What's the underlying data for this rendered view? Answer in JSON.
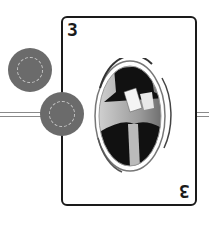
{
  "card": {
    "rank_top": "3",
    "rank_bottom": "3",
    "border_color": "#1a1a1a"
  },
  "chips": [
    {
      "color": "#6b6b6b",
      "ring": "dashed"
    },
    {
      "color": "#6b6b6b",
      "ring": "dashed"
    }
  ],
  "portrait": {
    "subject": "magician-with-top-hat-holding-cards",
    "style": "grayscale-oval"
  },
  "icons": [
    "chip-icon",
    "playing-card-icon",
    "magician-portrait"
  ]
}
